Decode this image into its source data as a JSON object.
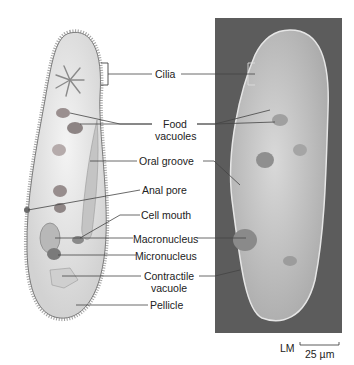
{
  "figure": {
    "left_panel": "drawing",
    "right_panel": "light micrograph"
  },
  "labels": [
    {
      "id": "cilia",
      "text": "Cilia"
    },
    {
      "id": "food-vacuoles",
      "line1": "Food",
      "line2": "vacuoles"
    },
    {
      "id": "oral-groove",
      "text": "Oral groove"
    },
    {
      "id": "anal-pore",
      "text": "Anal pore"
    },
    {
      "id": "cell-mouth",
      "text": "Cell mouth"
    },
    {
      "id": "macronucleus",
      "text": "Macronucleus"
    },
    {
      "id": "micronucleus",
      "text": "Micronucleus"
    },
    {
      "id": "contractile-vacuole",
      "line1": "Contractile",
      "line2": "vacuole"
    },
    {
      "id": "pellicle",
      "text": "Pellicle"
    }
  ],
  "scale_bar": {
    "method": "LM",
    "length": "25 µm"
  },
  "colors": {
    "leader_line": "#444444",
    "photo_bg": "#5c5c5c",
    "cell_fill": "#e8e8e8"
  }
}
